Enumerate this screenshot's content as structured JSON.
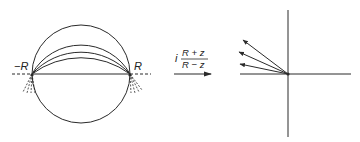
{
  "diagram": {
    "left_panel": {
      "label_left": "−R",
      "label_right": "R",
      "circle": {
        "cx": 81,
        "cy": 74,
        "r": 49
      },
      "arc_count": 4
    },
    "mapping": {
      "prefix": "i",
      "numerator": "R + z",
      "denominator": "R − z"
    },
    "right_panel": {
      "origin": [
        288,
        74
      ],
      "ray_count": 4
    },
    "colors": {
      "stroke": "#2a2a2a",
      "background": "#ffffff"
    }
  }
}
